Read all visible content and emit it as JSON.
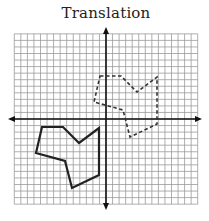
{
  "title": "Translation",
  "grid": {
    "origin_px": [
      106,
      119
    ],
    "cell_px": 6.55,
    "x_cells": [
      -14,
      14
    ],
    "y_cells": [
      -13,
      13
    ],
    "line_color": "#9a9a9a",
    "axis_color": "#111111"
  },
  "shapes": {
    "preimage": {
      "style": "solid",
      "color": "#222222",
      "vertices_px": [
        [
          42,
          127
        ],
        [
          63,
          127
        ],
        [
          79,
          143
        ],
        [
          99,
          128
        ],
        [
          99,
          175
        ],
        [
          72,
          188
        ],
        [
          65,
          161
        ],
        [
          36,
          153
        ]
      ]
    },
    "image": {
      "style": "dashed",
      "color": "#333333",
      "vertices_px": [
        [
          100,
          76
        ],
        [
          121,
          76
        ],
        [
          137,
          92
        ],
        [
          157,
          77
        ],
        [
          157,
          124
        ],
        [
          130,
          137
        ],
        [
          123,
          110
        ],
        [
          94,
          102
        ]
      ]
    }
  },
  "translation_vector_cells": [
    9,
    8
  ]
}
